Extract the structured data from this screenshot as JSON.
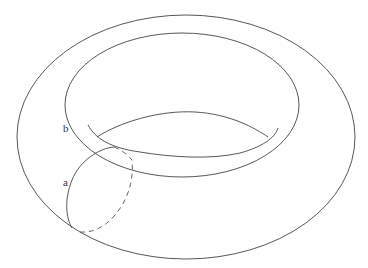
{
  "diagram": {
    "labels": {
      "a": "a",
      "b": "b"
    },
    "colors": {
      "line": "#444444",
      "background": "#ffffff"
    },
    "curves": [
      {
        "name": "outer-boundary",
        "style": "solid"
      },
      {
        "name": "inner-hole-boundary",
        "style": "solid"
      },
      {
        "name": "hole-lower-rim",
        "style": "solid"
      },
      {
        "name": "hole-upper-arc",
        "style": "solid"
      },
      {
        "name": "curve-a-front",
        "style": "solid"
      },
      {
        "name": "curve-a-back",
        "style": "dashed"
      }
    ]
  }
}
